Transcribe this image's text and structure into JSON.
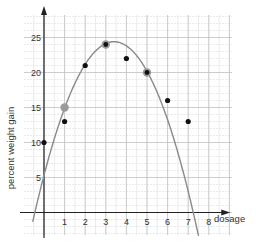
{
  "chart_data": {
    "type": "scatter",
    "title": "",
    "xlabel": "dosage",
    "ylabel": "percent weight gain",
    "xlim": [
      -0.5,
      9
    ],
    "ylim": [
      -3,
      28
    ],
    "x_ticks": [
      "1",
      "2",
      "3",
      "4",
      "5",
      "6",
      "7",
      "8"
    ],
    "y_ticks": [
      "5",
      "10",
      "15",
      "20",
      "25"
    ],
    "grid": true,
    "series": [
      {
        "name": "observations",
        "points": [
          {
            "x": 0,
            "y": 10,
            "highlight": false
          },
          {
            "x": 1,
            "y": 13,
            "highlight": false
          },
          {
            "x": 1,
            "y": 15,
            "highlight": true
          },
          {
            "x": 2,
            "y": 21,
            "highlight": false
          },
          {
            "x": 3,
            "y": 24,
            "highlight": true
          },
          {
            "x": 4,
            "y": 22,
            "highlight": false
          },
          {
            "x": 5,
            "y": 20,
            "highlight": true
          },
          {
            "x": 6,
            "y": 16,
            "highlight": false
          },
          {
            "x": 7,
            "y": 13,
            "highlight": false
          }
        ]
      }
    ],
    "fit_curve": {
      "type": "quadratic",
      "vertex": {
        "x": 3.4,
        "y": 24.4
      },
      "a": -1.65,
      "x_range": [
        -0.55,
        7.5
      ]
    },
    "colors": {
      "point": "#111111",
      "highlight": "#9a9a9a",
      "curve": "#8a8a8a",
      "grid_major": "#bdbdbd",
      "grid_minor": "#dedede",
      "axis": "#222222"
    }
  }
}
